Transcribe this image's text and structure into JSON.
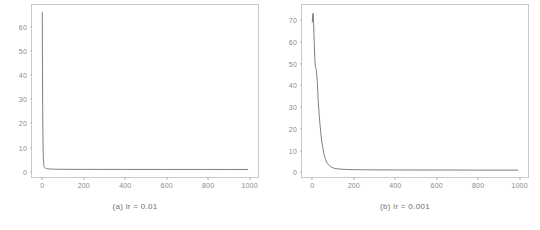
{
  "figure": {
    "background": "#ffffff",
    "line_color": "#6e6e6e",
    "axis_color": "#c9c9c9",
    "tick_label_color": "#8a8a8a"
  },
  "panels": [
    {
      "caption": "(a) lr = 0.01",
      "chart_data": {
        "type": "line",
        "title": "",
        "xlabel": "",
        "ylabel": "",
        "xlim": [
          -50,
          1050
        ],
        "ylim": [
          -3,
          69
        ],
        "grid": false,
        "legend": null,
        "xticks": [
          0,
          200,
          400,
          600,
          800,
          1000
        ],
        "yticks": [
          0,
          10,
          20,
          30,
          40,
          50,
          60
        ],
        "series": [
          {
            "name": "loss",
            "x": [
              0,
              1,
              2,
              3,
              4,
              5,
              6,
              7,
              8,
              9,
              10,
              12,
              14,
              16,
              18,
              20,
              25,
              30,
              40,
              50,
              60,
              80,
              100,
              150,
              200,
              300,
              400,
              500,
              600,
              700,
              800,
              900,
              1000
            ],
            "y": [
              66.0,
              44.0,
              26.0,
              15.0,
              9.0,
              5.5,
              3.6,
              2.5,
              1.9,
              1.5,
              1.25,
              0.95,
              0.8,
              0.7,
              0.62,
              0.56,
              0.46,
              0.4,
              0.33,
              0.29,
              0.27,
              0.24,
              0.22,
              0.2,
              0.19,
              0.18,
              0.17,
              0.17,
              0.16,
              0.16,
              0.16,
              0.15,
              0.15
            ]
          }
        ]
      }
    },
    {
      "caption": "(b) lr = 0.001",
      "chart_data": {
        "type": "line",
        "title": "",
        "xlabel": "",
        "ylabel": "",
        "xlim": [
          -50,
          1050
        ],
        "ylim": [
          -3,
          77
        ],
        "grid": false,
        "legend": null,
        "xticks": [
          0,
          200,
          400,
          600,
          800,
          1000
        ],
        "yticks": [
          0,
          10,
          20,
          30,
          40,
          50,
          60,
          70
        ],
        "series": [
          {
            "name": "loss",
            "x": [
              0,
              2,
              4,
              5,
              6,
              8,
              10,
              12,
              14,
              16,
              18,
              20,
              22,
              24,
              26,
              28,
              30,
              34,
              38,
              42,
              46,
              50,
              55,
              60,
              65,
              70,
              75,
              80,
              90,
              100,
              110,
              120,
              130,
              150,
              175,
              200,
              250,
              300,
              400,
              500,
              600,
              700,
              800,
              900,
              1000
            ],
            "y": [
              69.0,
              72.0,
              73.2,
              72.5,
              70.0,
              64.0,
              58.0,
              53.0,
              49.5,
              48.0,
              47.5,
              46.5,
              44.5,
              41.5,
              38.0,
              34.5,
              31.0,
              25.5,
              21.0,
              17.0,
              13.8,
              11.2,
              8.6,
              6.6,
              5.1,
              4.0,
              3.2,
              2.6,
              1.8,
              1.3,
              1.0,
              0.85,
              0.72,
              0.58,
              0.48,
              0.42,
              0.36,
              0.32,
              0.28,
              0.26,
              0.24,
              0.23,
              0.22,
              0.21,
              0.2
            ]
          }
        ]
      }
    }
  ]
}
